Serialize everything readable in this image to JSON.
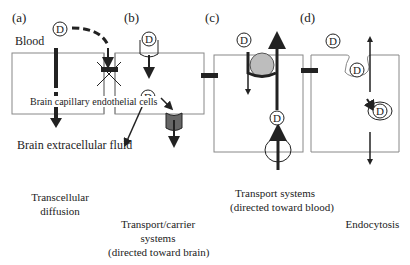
{
  "panels": [
    {
      "id": "a",
      "label": "(a)",
      "caption": [
        "Transcellular",
        "diffusion"
      ]
    },
    {
      "id": "b",
      "label": "(b)",
      "caption": [
        "Transport/carrier",
        "systems",
        "(directed toward brain)"
      ]
    },
    {
      "id": "c",
      "label": "(c)",
      "caption": [
        "Transport systems",
        "(directed toward blood)"
      ]
    },
    {
      "id": "d",
      "label": "(d)",
      "caption": [
        "Endocytosis"
      ]
    }
  ],
  "labels": {
    "blood": "Blood",
    "endothelial": "Brain capillary endothelial cells",
    "extracellular": "Brain extracellular fluid"
  },
  "drug_symbol": "D",
  "colors": {
    "line": "#222222",
    "membrane": "#888888",
    "carrier_fill": "#777777",
    "transporter_fill": "#bdbdbd"
  }
}
